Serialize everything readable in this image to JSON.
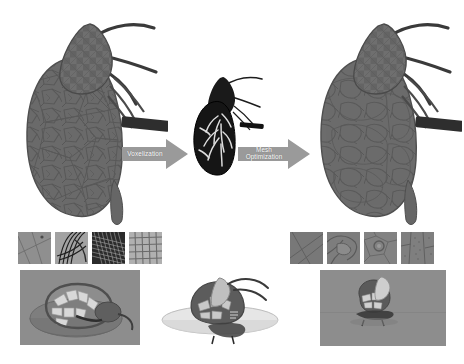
{
  "figure": {
    "background_color": "#ffffff",
    "mesh_color": "#6b6b6b",
    "mesh_dark_color": "#4a4a4a",
    "voxel_color": "#1c1c1c",
    "arrow_color": "#9a9a9a",
    "arrow_text_color": "#ffffff",
    "panel_bg_color": "#8d8d8d"
  },
  "pipeline": {
    "steps": [
      {
        "id": "input-mesh",
        "label": "Input surface mesh",
        "description": "Coarse irregular triangulated kidney surface mesh with renal vessels and ureter"
      },
      {
        "id": "voxel-model",
        "label": "Voxelized volume",
        "description": "Dark voxel volume of kidney with internal collecting system visible"
      },
      {
        "id": "optimized-mesh",
        "label": "Optimized surface mesh",
        "description": "Smoothed, remeshed kidney surface with uniform triangulation"
      }
    ],
    "arrows": [
      {
        "id": "arrow-voxelization",
        "label": "Voxelization"
      },
      {
        "id": "arrow-mesh-optimization",
        "label": "Mesh\nOptimization"
      }
    ]
  },
  "detail_strips": {
    "left": {
      "caption": "Input mesh wireframe detail",
      "thumbnails": [
        {
          "id": "left-thumb-1",
          "label": "Coarse triangles closeup"
        },
        {
          "id": "left-thumb-2",
          "label": "Dense sliver triangles"
        },
        {
          "id": "left-thumb-3",
          "label": "Moire wireframe band"
        },
        {
          "id": "left-thumb-4",
          "label": "Regular grid wireframe"
        }
      ]
    },
    "right": {
      "caption": "Optimized mesh wireframe detail",
      "thumbnails": [
        {
          "id": "right-thumb-1",
          "label": "Smooth large facets"
        },
        {
          "id": "right-thumb-2",
          "label": "Curved vessel facets"
        },
        {
          "id": "right-thumb-3",
          "label": "Uniform remeshed patch"
        },
        {
          "id": "right-thumb-4",
          "label": "Fine stippled facets"
        }
      ]
    }
  },
  "render_panels": [
    {
      "id": "panel-left-cutaway",
      "label": "Cut-away cross-section render (input)",
      "background": "#8d8d8d"
    },
    {
      "id": "panel-center-clipplane",
      "label": "Clipping plane render on white",
      "background": "#ffffff"
    },
    {
      "id": "panel-right-cutaway",
      "label": "Cut-away cross-section render (optimized)",
      "background": "#8d8d8d"
    }
  ]
}
